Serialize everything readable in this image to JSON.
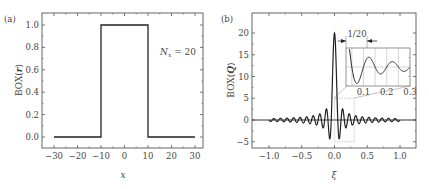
{
  "chart_data": [
    {
      "panel": "(a)",
      "type": "line",
      "title": "",
      "xlabel": "x",
      "ylabel": "BOX(r)",
      "ylabel_parts": {
        "prefix": "BOX",
        "arg": "r"
      },
      "xlim": [
        -35,
        35
      ],
      "ylim": [
        -0.1,
        1.1
      ],
      "xticks": [
        -30,
        -20,
        -10,
        0,
        10,
        20,
        30
      ],
      "xtick_labels": [
        "−30",
        "−20",
        "−10",
        "0",
        "10",
        "20",
        "30"
      ],
      "yticks": [
        0.0,
        0.2,
        0.4,
        0.6,
        0.8,
        1.0
      ],
      "ytick_labels": [
        "0.0",
        "0.2",
        "0.4",
        "0.6",
        "0.8",
        "1.0"
      ],
      "annotation": {
        "text_prefix": "N",
        "subscript": "x",
        "text_suffix": " = 20"
      },
      "grid": false,
      "series": [
        {
          "name": "BOX(r)",
          "x": [
            -30,
            -10,
            -10,
            10,
            10,
            30
          ],
          "y": [
            0,
            0,
            1,
            1,
            0,
            0
          ]
        }
      ]
    },
    {
      "panel": "(b)",
      "type": "line",
      "title": "",
      "xlabel": "ξ",
      "ylabel": "BOX(Q)",
      "ylabel_parts": {
        "prefix": "BOX",
        "arg": "Q"
      },
      "xlim": [
        -1.25,
        1.25
      ],
      "ylim": [
        -6.5,
        24.5
      ],
      "xticks": [
        -1.0,
        -0.5,
        0.0,
        0.5,
        1.0
      ],
      "xtick_labels": [
        "−1.0",
        "−0.5",
        "0.0",
        "0.5",
        "1.0"
      ],
      "yticks": [
        -5,
        0,
        5,
        10,
        15,
        20
      ],
      "ytick_labels": [
        "−5",
        "0",
        "5",
        "10",
        "15",
        "20"
      ],
      "grid": false,
      "function": "20*sin(20*pi*xi)/(20*pi*xi)",
      "x_range": [
        -1.0,
        1.0
      ],
      "sample_points": {
        "x": [
          0.0,
          0.025,
          0.05,
          0.072,
          0.1,
          0.122,
          0.15,
          0.174,
          0.2,
          0.25,
          0.3
        ],
        "y": [
          20.0,
          12.7,
          0.0,
          -4.3,
          0.0,
          2.5,
          0.0,
          -1.8,
          0.0,
          0.0,
          0.0
        ]
      },
      "zoom_box": {
        "x": [
          0.0,
          0.3
        ],
        "y": [
          -5,
          5
        ]
      },
      "inset": {
        "xticks": [
          0.1,
          0.2,
          0.3
        ],
        "xtick_labels": [
          "0.1",
          "0.2",
          "0.3"
        ],
        "annotation": "1/20"
      }
    }
  ]
}
